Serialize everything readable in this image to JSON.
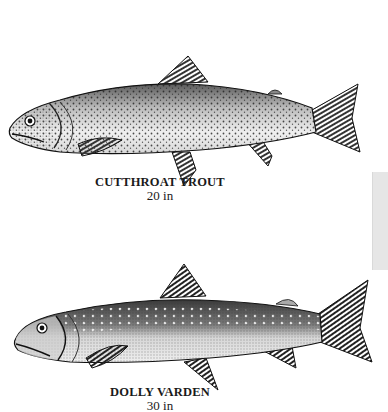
{
  "page": {
    "background": "#ffffff"
  },
  "fish": [
    {
      "name": "CUTTHROAT TROUT",
      "size": "20 in",
      "illustration": "cutthroat-trout-stipple-drawing"
    },
    {
      "name": "DOLLY VARDEN",
      "size": "30 in",
      "illustration": "dolly-varden-stipple-drawing"
    }
  ],
  "side_tab": {
    "color": "#e6e6e6"
  }
}
